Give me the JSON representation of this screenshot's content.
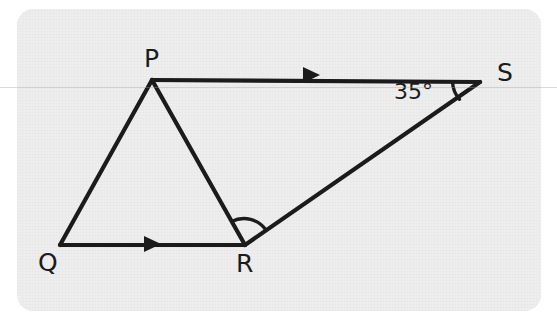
{
  "figure": {
    "type": "geometry-diagram",
    "background_color": "#eeeeee",
    "stroke_color": "#1b1b1b",
    "panel": {
      "x": 17,
      "y": 9,
      "width": 524,
      "height": 302,
      "corner_radius": 16
    },
    "vertices": [
      {
        "id": "P",
        "label": "P",
        "x": 152,
        "y": 80,
        "label_x": 144,
        "label_y": 46
      },
      {
        "id": "Q",
        "label": "Q",
        "x": 60,
        "y": 245,
        "label_x": 38,
        "label_y": 250
      },
      {
        "id": "R",
        "label": "R",
        "x": 245,
        "y": 245,
        "label_x": 236,
        "label_y": 251
      },
      {
        "id": "S",
        "label": "S",
        "x": 480,
        "y": 82,
        "label_x": 497,
        "label_y": 60
      }
    ],
    "segments": [
      {
        "id": "PQ",
        "from": "P",
        "to": "Q",
        "arrow": false
      },
      {
        "id": "QR",
        "from": "Q",
        "to": "R",
        "arrow": true,
        "arrow_at": {
          "x": 152,
          "y": 244
        }
      },
      {
        "id": "PR",
        "from": "P",
        "to": "R",
        "arrow": false
      },
      {
        "id": "PS",
        "from": "P",
        "to": "S",
        "arrow": true,
        "arrow_at": {
          "x": 311,
          "y": 75
        }
      },
      {
        "id": "RS",
        "from": "R",
        "to": "S",
        "arrow": false
      }
    ],
    "angle_marks": [
      {
        "id": "angle-R",
        "vertex": "R",
        "between": [
          "PR",
          "RS"
        ],
        "label": "",
        "radius": 24
      },
      {
        "id": "angle-S",
        "vertex": "S",
        "between": [
          "SP",
          "SR"
        ],
        "label": "35°",
        "radius": 26
      }
    ],
    "labels": {
      "angle_s": "35°"
    },
    "parallel_marks_note": "single arrowheads on PS and QR indicate the pair of parallel lines"
  }
}
